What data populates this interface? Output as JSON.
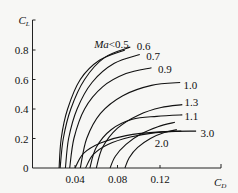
{
  "chart_data": {
    "type": "line",
    "title": "",
    "xlabel": "C_D",
    "ylabel": "C_L",
    "xlim": [
      0,
      0.165
    ],
    "ylim": [
      0,
      0.9
    ],
    "xticks": [
      0.04,
      0.08,
      0.12
    ],
    "xtick_labels": [
      "0.04",
      "0.08",
      "0.12"
    ],
    "yticks": [
      0,
      0.2,
      0.4,
      0.6,
      0.8
    ],
    "ytick_labels": [
      "0",
      "0.2",
      "0.4",
      "0.6",
      "0.8"
    ],
    "grid": false,
    "legend": "inline labels at curve ends",
    "series": [
      {
        "name": "Ma<0.5",
        "label": "Ma<0.5",
        "x": [
          0.025,
          0.027,
          0.033,
          0.045,
          0.063,
          0.087
        ],
        "y": [
          0.0,
          0.2,
          0.4,
          0.6,
          0.73,
          0.8
        ],
        "label_pos": [
          0.058,
          0.84
        ]
      },
      {
        "name": "0.6",
        "label": "0.6",
        "x": [
          0.026,
          0.029,
          0.036,
          0.049,
          0.068,
          0.092
        ],
        "y": [
          0.0,
          0.2,
          0.4,
          0.6,
          0.75,
          0.82
        ],
        "label_pos": [
          0.098,
          0.83
        ]
      },
      {
        "name": "0.7",
        "label": "0.7",
        "x": [
          0.031,
          0.034,
          0.042,
          0.056,
          0.077,
          0.101
        ],
        "y": [
          0.0,
          0.2,
          0.4,
          0.58,
          0.71,
          0.77
        ],
        "label_pos": [
          0.107,
          0.76
        ]
      },
      {
        "name": "0.9",
        "label": "0.9",
        "x": [
          0.035,
          0.039,
          0.049,
          0.066,
          0.088,
          0.112
        ],
        "y": [
          0.0,
          0.2,
          0.4,
          0.55,
          0.64,
          0.68
        ],
        "label_pos": [
          0.118,
          0.67
        ]
      },
      {
        "name": "1.0",
        "label": "1.0",
        "x": [
          0.045,
          0.051,
          0.064,
          0.085,
          0.112,
          0.139
        ],
        "y": [
          0.0,
          0.2,
          0.37,
          0.49,
          0.56,
          0.58
        ],
        "label_pos": [
          0.142,
          0.56
        ]
      },
      {
        "name": "1.3",
        "label": "1.3",
        "x": [
          0.06,
          0.066,
          0.08,
          0.1,
          0.121,
          0.141
        ],
        "y": [
          0.0,
          0.14,
          0.27,
          0.36,
          0.41,
          0.43
        ],
        "label_pos": [
          0.143,
          0.45
        ]
      },
      {
        "name": "1.1",
        "label": "1.1",
        "x": [
          0.054,
          0.06,
          0.074,
          0.094,
          0.117,
          0.141
        ],
        "y": [
          0.0,
          0.14,
          0.26,
          0.33,
          0.35,
          0.36
        ],
        "label_pos": [
          0.143,
          0.35
        ]
      },
      {
        "name": "3.0",
        "label": "3.0",
        "x": [
          0.04,
          0.048,
          0.064,
          0.088,
          0.12,
          0.154
        ],
        "y": [
          0.0,
          0.1,
          0.17,
          0.22,
          0.245,
          0.25
        ],
        "label_pos": [
          0.158,
          0.24
        ]
      },
      {
        "name": "2.0",
        "label": "2.0",
        "x": [
          0.05,
          0.057,
          0.071,
          0.092,
          0.116,
          0.14
        ],
        "y": [
          0.0,
          0.09,
          0.16,
          0.21,
          0.24,
          0.25
        ],
        "label_pos": [
          0.115,
          0.17
        ]
      },
      {
        "name": "unlabeled-a",
        "label": "",
        "x": [
          0.073,
          0.078,
          0.088,
          0.102,
          0.118,
          0.134
        ],
        "y": [
          0.0,
          0.08,
          0.16,
          0.23,
          0.28,
          0.31
        ]
      },
      {
        "name": "unlabeled-b",
        "label": "",
        "x": [
          0.087,
          0.091,
          0.099,
          0.111,
          0.124,
          0.136
        ],
        "y": [
          0.0,
          0.07,
          0.14,
          0.2,
          0.24,
          0.26
        ]
      }
    ]
  },
  "axes": {
    "x_label_main": "C",
    "x_label_sub": "D",
    "y_label_main": "C",
    "y_label_sub": "L",
    "origin_label": "0"
  },
  "colors": {
    "background": "#f7f7f5",
    "ink": "#111111"
  }
}
